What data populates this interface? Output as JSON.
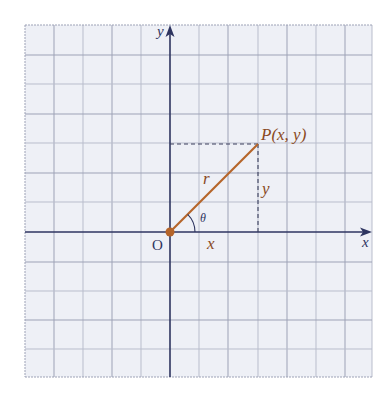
{
  "diagram": {
    "type": "polar-coordinates-figure",
    "colors": {
      "background": "#ffffff",
      "grid_fill": "#eef0f6",
      "grid_major": "#8a8fa3",
      "grid_minor": "#b9bdcc",
      "axis": "#2e3560",
      "segment": "#b5652a",
      "label_brown": "#8a4a1e",
      "label_dark": "#2e3560"
    },
    "axes": {
      "x_label": "x",
      "y_label": "y",
      "origin_label": "O"
    },
    "point": {
      "label": "P(x, y)"
    },
    "segments": {
      "r_label": "r",
      "x_label": "x",
      "y_label": "y",
      "angle_label": "θ"
    }
  }
}
